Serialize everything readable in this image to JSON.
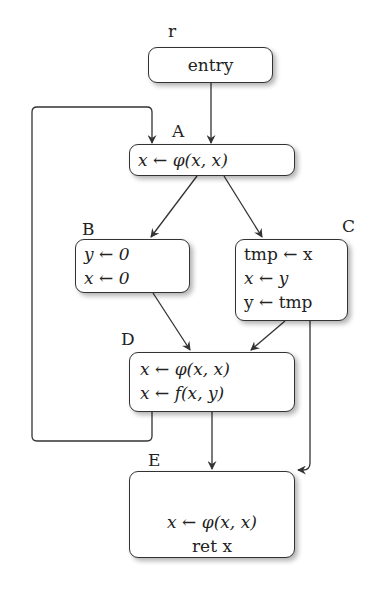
{
  "diagram": {
    "type": "control-flow-graph",
    "nodes": [
      {
        "id": "r",
        "label": "r",
        "lines": [
          "entry"
        ]
      },
      {
        "id": "A",
        "label": "A",
        "lines": [
          "x ← φ(x, x)"
        ]
      },
      {
        "id": "B",
        "label": "B",
        "lines": [
          "y ← 0",
          "x ← 0"
        ]
      },
      {
        "id": "C",
        "label": "C",
        "lines": [
          "tmp ← x",
          "x ← y",
          "y ← tmp"
        ]
      },
      {
        "id": "D",
        "label": "D",
        "lines": [
          "x ← φ(x, x)",
          "x ← f(x, y)"
        ]
      },
      {
        "id": "E",
        "label": "E",
        "lines": [
          "x ← φ(x, x)",
          "ret x"
        ]
      }
    ],
    "edges": [
      {
        "from": "r",
        "to": "A"
      },
      {
        "from": "A",
        "to": "B"
      },
      {
        "from": "A",
        "to": "C"
      },
      {
        "from": "B",
        "to": "D"
      },
      {
        "from": "C",
        "to": "D"
      },
      {
        "from": "C",
        "to": "E"
      },
      {
        "from": "D",
        "to": "E"
      },
      {
        "from": "D",
        "to": "A"
      }
    ],
    "colors": {
      "stroke": "#333333",
      "background": "#ffffff"
    }
  }
}
